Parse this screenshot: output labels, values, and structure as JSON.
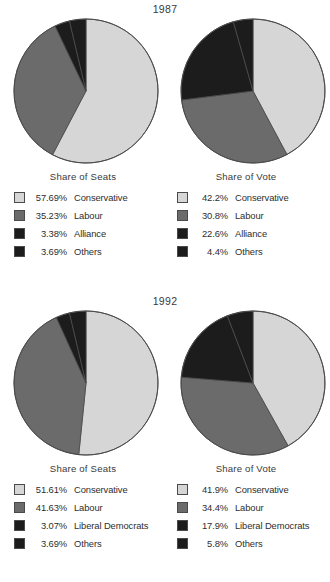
{
  "colors": {
    "conservative": "#d6d6d6",
    "labour": "#6b6b6b",
    "alliance": "#1c1c1c",
    "liberal_democrats": "#1c1c1c",
    "others": "#1c1c1c",
    "outline": "#4a4a4a",
    "text": "#2e2e2e",
    "background": "#ffffff"
  },
  "panels": [
    {
      "year": "1987",
      "charts": [
        {
          "title": "Share of Seats",
          "legend": [
            {
              "pct": "57.69%",
              "label": "Conservative",
              "swatch": "#d6d6d6"
            },
            {
              "pct": "35.23%",
              "label": "Labour",
              "swatch": "#6b6b6b"
            },
            {
              "pct": "3.38%",
              "label": "Alliance",
              "swatch": "#1c1c1c"
            },
            {
              "pct": "3.69%",
              "label": "Others",
              "swatch": "#1c1c1c"
            }
          ]
        },
        {
          "title": "Share of Vote",
          "legend": [
            {
              "pct": "42.2%",
              "label": "Conservative",
              "swatch": "#d6d6d6"
            },
            {
              "pct": "30.8%",
              "label": "Labour",
              "swatch": "#6b6b6b"
            },
            {
              "pct": "22.6%",
              "label": "Alliance",
              "swatch": "#1c1c1c"
            },
            {
              "pct": "4.4%",
              "label": "Others",
              "swatch": "#1c1c1c"
            }
          ]
        }
      ]
    },
    {
      "year": "1992",
      "charts": [
        {
          "title": "Share of Seats",
          "legend": [
            {
              "pct": "51.61%",
              "label": "Conservative",
              "swatch": "#d6d6d6"
            },
            {
              "pct": "41.63%",
              "label": "Labour",
              "swatch": "#6b6b6b"
            },
            {
              "pct": "3.07%",
              "label": "Liberal Democrats",
              "swatch": "#1c1c1c"
            },
            {
              "pct": "3.69%",
              "label": "Others",
              "swatch": "#1c1c1c"
            }
          ]
        },
        {
          "title": "Share of Vote",
          "legend": [
            {
              "pct": "41.9%",
              "label": "Conservative",
              "swatch": "#d6d6d6"
            },
            {
              "pct": "34.4%",
              "label": "Labour",
              "swatch": "#6b6b6b"
            },
            {
              "pct": "17.9%",
              "label": "Liberal Democrats",
              "swatch": "#1c1c1c"
            },
            {
              "pct": "5.8%",
              "label": "Others",
              "swatch": "#1c1c1c"
            }
          ]
        }
      ]
    }
  ],
  "chart_data": [
    {
      "type": "pie",
      "title": "1987 Share of Seats",
      "labels": [
        "Conservative",
        "Labour",
        "Alliance",
        "Others"
      ],
      "values": [
        57.69,
        35.23,
        3.38,
        3.69
      ],
      "colors": [
        "#d6d6d6",
        "#6b6b6b",
        "#1c1c1c",
        "#1c1c1c"
      ],
      "legend": "below",
      "start_angle_deg": 0,
      "direction": "clockwise"
    },
    {
      "type": "pie",
      "title": "1987 Share of Vote",
      "labels": [
        "Conservative",
        "Labour",
        "Alliance",
        "Others"
      ],
      "values": [
        42.2,
        30.8,
        22.6,
        4.4
      ],
      "colors": [
        "#d6d6d6",
        "#6b6b6b",
        "#1c1c1c",
        "#1c1c1c"
      ],
      "legend": "below",
      "start_angle_deg": 0,
      "direction": "clockwise"
    },
    {
      "type": "pie",
      "title": "1992 Share of Seats",
      "labels": [
        "Conservative",
        "Labour",
        "Liberal Democrats",
        "Others"
      ],
      "values": [
        51.61,
        41.63,
        3.07,
        3.69
      ],
      "colors": [
        "#d6d6d6",
        "#6b6b6b",
        "#1c1c1c",
        "#1c1c1c"
      ],
      "legend": "below",
      "start_angle_deg": 0,
      "direction": "clockwise"
    },
    {
      "type": "pie",
      "title": "1992 Share of Vote",
      "labels": [
        "Conservative",
        "Labour",
        "Liberal Democrats",
        "Others"
      ],
      "values": [
        41.9,
        34.4,
        17.9,
        5.8
      ],
      "colors": [
        "#d6d6d6",
        "#6b6b6b",
        "#1c1c1c",
        "#1c1c1c"
      ],
      "legend": "below",
      "start_angle_deg": 0,
      "direction": "clockwise"
    }
  ]
}
